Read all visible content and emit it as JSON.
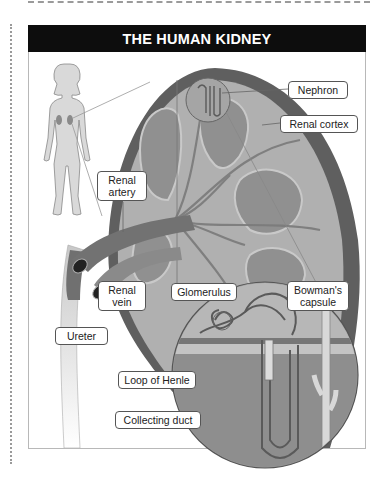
{
  "title": "THE HUMAN KIDNEY",
  "labels": {
    "nephron": "Nephron",
    "renal_cortex": "Renal cortex",
    "renal_artery_1": "Renal",
    "renal_artery_2": "artery",
    "renal_vein_1": "Renal",
    "renal_vein_2": "vein",
    "glomerulus": "Glomerulus",
    "bowmans_capsule_1": "Bowman's",
    "bowmans_capsule_2": "capsule",
    "ureter": "Ureter",
    "loop_of_henle": "Loop of Henle",
    "collecting_duct": "Collecting duct"
  },
  "colors": {
    "title_bg": "#0d0d0d",
    "kidney_capsule": "#5f5f5f",
    "kidney_cortex": "#a8a8a8",
    "medulla": "#8a8a8a",
    "vessel": "#6e6e6e",
    "magnifier_bg": "#9a9a9a"
  }
}
